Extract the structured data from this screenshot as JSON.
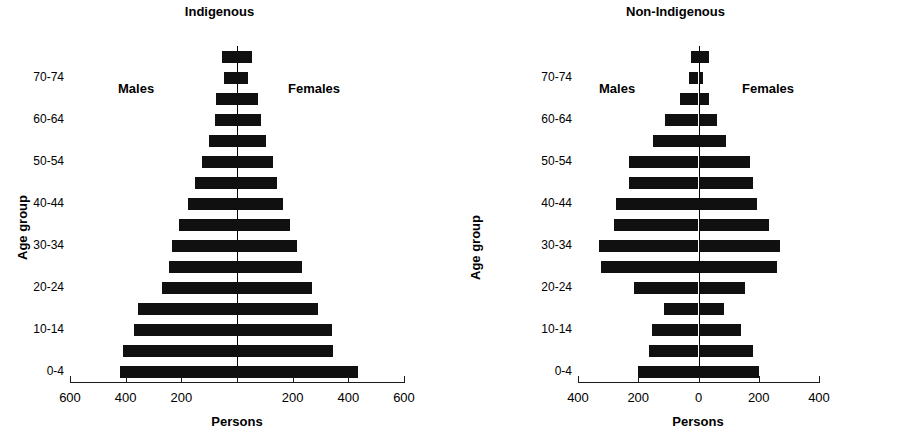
{
  "figure": {
    "panels": [
      {
        "id": "left",
        "title": "Indigenous",
        "males_label": "Males",
        "females_label": "Females",
        "xlabel": "Persons",
        "ylabel": "Age group",
        "xticks": [
          "600",
          "400",
          "200",
          "",
          "200",
          "400",
          "600"
        ]
      },
      {
        "id": "right",
        "title": "Non-Indigenous",
        "males_label": "Males",
        "females_label": "Females",
        "xlabel": "Persons",
        "ylabel": "Age group",
        "xticks": [
          "400",
          "200",
          "0",
          "200",
          "400"
        ]
      }
    ],
    "ytick_labels": [
      "70-74",
      "60-64",
      "50-54",
      "40-44",
      "30-34",
      "20-24",
      "10-14",
      "0-4"
    ]
  },
  "chart_data": [
    {
      "type": "bar",
      "subtype": "population-pyramid",
      "title": "Indigenous",
      "xlabel": "Persons",
      "ylabel": "Age group",
      "xlim": [
        -600,
        600
      ],
      "xticks": [
        -600,
        -400,
        -200,
        0,
        200,
        400,
        600
      ],
      "xtick_labels": [
        "600",
        "400",
        "200",
        "",
        "200",
        "400",
        "600"
      ],
      "grid": false,
      "legend": "none",
      "annotations": [
        "Males",
        "Females"
      ],
      "categories": [
        "0-4",
        "5-9",
        "10-14",
        "15-19",
        "20-24",
        "25-29",
        "30-34",
        "35-39",
        "40-44",
        "45-49",
        "50-54",
        "55-59",
        "60-64",
        "65-69",
        "70-74",
        "75+"
      ],
      "series": [
        {
          "name": "Males",
          "side": "left",
          "values": [
            420,
            410,
            370,
            355,
            270,
            245,
            235,
            210,
            175,
            150,
            125,
            100,
            80,
            75,
            45,
            55
          ]
        },
        {
          "name": "Females",
          "side": "right",
          "values": [
            435,
            345,
            340,
            290,
            270,
            235,
            215,
            190,
            165,
            145,
            130,
            105,
            85,
            75,
            40,
            55
          ]
        }
      ]
    },
    {
      "type": "bar",
      "subtype": "population-pyramid",
      "title": "Non-Indigenous",
      "xlabel": "Persons",
      "ylabel": "Age group",
      "xlim": [
        -400,
        400
      ],
      "xticks": [
        -400,
        -200,
        0,
        200,
        400
      ],
      "xtick_labels": [
        "400",
        "200",
        "0",
        "200",
        "400"
      ],
      "grid": false,
      "legend": "none",
      "annotations": [
        "Males",
        "Females"
      ],
      "categories": [
        "0-4",
        "5-9",
        "10-14",
        "15-19",
        "20-24",
        "25-29",
        "30-34",
        "35-39",
        "40-44",
        "45-49",
        "50-54",
        "55-59",
        "60-64",
        "65-69",
        "70-74",
        "75+"
      ],
      "series": [
        {
          "name": "Males",
          "side": "left",
          "values": [
            200,
            165,
            155,
            115,
            215,
            325,
            330,
            280,
            275,
            230,
            230,
            150,
            110,
            60,
            30,
            25
          ]
        },
        {
          "name": "Females",
          "side": "right",
          "values": [
            200,
            180,
            140,
            85,
            155,
            260,
            270,
            235,
            195,
            180,
            170,
            90,
            60,
            35,
            15,
            35
          ]
        }
      ]
    }
  ]
}
